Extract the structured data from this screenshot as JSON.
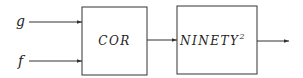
{
  "diagram": {
    "inputs": [
      {
        "label": "g"
      },
      {
        "label": "f"
      }
    ],
    "blocks": [
      {
        "label": "COR"
      },
      {
        "label": "NINETY",
        "superscript": "2"
      }
    ],
    "colors": {
      "line": "#333333",
      "text": "#222222",
      "background": "#ffffff"
    }
  }
}
